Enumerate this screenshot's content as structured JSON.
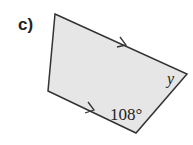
{
  "figure": {
    "label": "c)",
    "angle_label": "108°",
    "variable_label": "y",
    "fill_color": "#e6e6e6",
    "stroke_color": "#333333",
    "shape": "quadrilateral",
    "parallel_marks": "arrows on top and bottom sides"
  }
}
